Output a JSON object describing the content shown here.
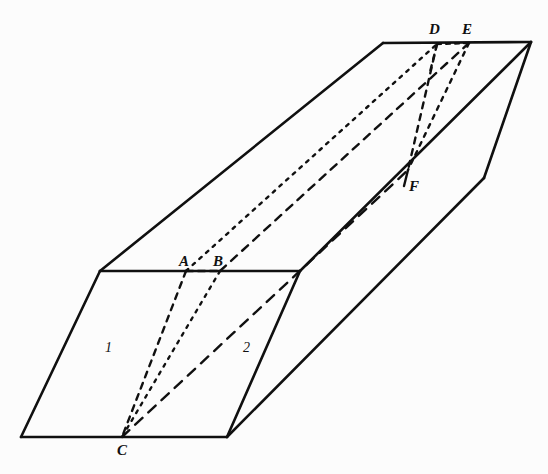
{
  "figure": {
    "background_color": "#fcfcfc",
    "stroke_color": "#101010",
    "solid_stroke_width": 2.6,
    "dashed_stroke_width": 2.4,
    "width": 548,
    "height": 474,
    "caption": ""
  },
  "labels": {
    "A": {
      "text": "A",
      "x": 179,
      "y": 254
    },
    "B": {
      "text": "B",
      "x": 213,
      "y": 254
    },
    "C": {
      "text": "C",
      "x": 117,
      "y": 443
    },
    "D": {
      "text": "D",
      "x": 429,
      "y": 22
    },
    "E": {
      "text": "E",
      "x": 462,
      "y": 22
    },
    "F": {
      "text": "F",
      "x": 409,
      "y": 179
    },
    "one": {
      "text": "1",
      "x": 105,
      "y": 341
    },
    "two": {
      "text": "2",
      "x": 243,
      "y": 341
    }
  },
  "points": {
    "front_top_left": {
      "name": "front-top-left",
      "x": 100,
      "y": 271
    },
    "front_top_right": {
      "name": "front-top-right",
      "x": 300,
      "y": 271
    },
    "front_bottom_left": {
      "name": "front-bottom-left",
      "x": 21,
      "y": 437
    },
    "front_bottom_right": {
      "name": "front-bottom-right",
      "x": 227,
      "y": 437
    },
    "top_back_left": {
      "name": "top-back-left",
      "x": 383,
      "y": 43
    },
    "top_back_right": {
      "name": "top-back-right",
      "x": 531,
      "y": 42
    },
    "right_lower_vertex": {
      "name": "right-lower-vertex",
      "x": 484,
      "y": 178
    },
    "A_point": {
      "name": "point-A",
      "x": 186,
      "y": 271
    },
    "B_point": {
      "name": "point-B",
      "x": 220,
      "y": 271
    },
    "C_point": {
      "name": "point-C",
      "x": 122,
      "y": 437
    },
    "D_point": {
      "name": "point-D",
      "x": 437,
      "y": 44
    },
    "E_point": {
      "name": "point-E",
      "x": 469,
      "y": 43
    },
    "F_point": {
      "name": "point-F",
      "x": 408,
      "y": 170
    }
  },
  "solid_edges": [
    {
      "name": "front-face-top-edge",
      "from": [
        100,
        271
      ],
      "to": [
        300,
        271
      ]
    },
    {
      "name": "front-face-left-edge",
      "from": [
        100,
        271
      ],
      "to": [
        21,
        437
      ]
    },
    {
      "name": "front-face-bottom-edge",
      "from": [
        21,
        437
      ],
      "to": [
        227,
        437
      ]
    },
    {
      "name": "front-face-right-edge",
      "from": [
        300,
        271
      ],
      "to": [
        227,
        437
      ]
    },
    {
      "name": "top-face-left-edge",
      "from": [
        100,
        271
      ],
      "to": [
        383,
        43
      ]
    },
    {
      "name": "top-face-back-edge",
      "from": [
        383,
        43
      ],
      "to": [
        531,
        42
      ]
    },
    {
      "name": "top-face-right-edge",
      "from": [
        300,
        271
      ],
      "to": [
        531,
        42
      ]
    },
    {
      "name": "right-face-back-edge",
      "from": [
        531,
        42
      ],
      "to": [
        484,
        178
      ]
    },
    {
      "name": "right-face-bottom-edge",
      "from": [
        484,
        178
      ],
      "to": [
        227,
        437
      ]
    }
  ],
  "dashed_edges": [
    {
      "name": "hidden-edge-A-to-C",
      "from": [
        186,
        271
      ],
      "to": [
        122,
        437
      ],
      "dash": "6,6"
    },
    {
      "name": "hidden-edge-B-to-C",
      "from": [
        220,
        271
      ],
      "to": [
        122,
        437
      ],
      "dash": "3,6"
    },
    {
      "name": "hidden-edge-A-to-D",
      "from": [
        186,
        271
      ],
      "to": [
        437,
        44
      ],
      "dash": "3,6"
    },
    {
      "name": "hidden-edge-B-to-E",
      "from": [
        220,
        271
      ],
      "to": [
        469,
        43
      ],
      "dash": "8,7"
    },
    {
      "name": "hidden-edge-A-to-B",
      "from": [
        186,
        271
      ],
      "to": [
        220,
        271
      ],
      "dash": "7,5"
    },
    {
      "name": "hidden-edge-D-to-E",
      "from": [
        437,
        44
      ],
      "to": [
        469,
        43
      ],
      "dash": "4,5"
    },
    {
      "name": "hidden-edge-D-to-F",
      "from": [
        437,
        44
      ],
      "to": [
        408,
        170
      ],
      "dash": "6,6"
    },
    {
      "name": "hidden-edge-E-to-F",
      "from": [
        469,
        43
      ],
      "to": [
        408,
        170
      ],
      "dash": "4,6"
    },
    {
      "name": "hidden-edge-C-to-F",
      "from": [
        122,
        437
      ],
      "to": [
        408,
        170
      ],
      "dash": "10,8"
    },
    {
      "name": "hidden-tick-D",
      "from": [
        437,
        44
      ],
      "to": [
        429,
        76
      ],
      "dash": "5,6"
    },
    {
      "name": "hidden-tick-F",
      "from": [
        408,
        170
      ],
      "to": [
        404,
        186
      ],
      "dash": "0"
    }
  ]
}
